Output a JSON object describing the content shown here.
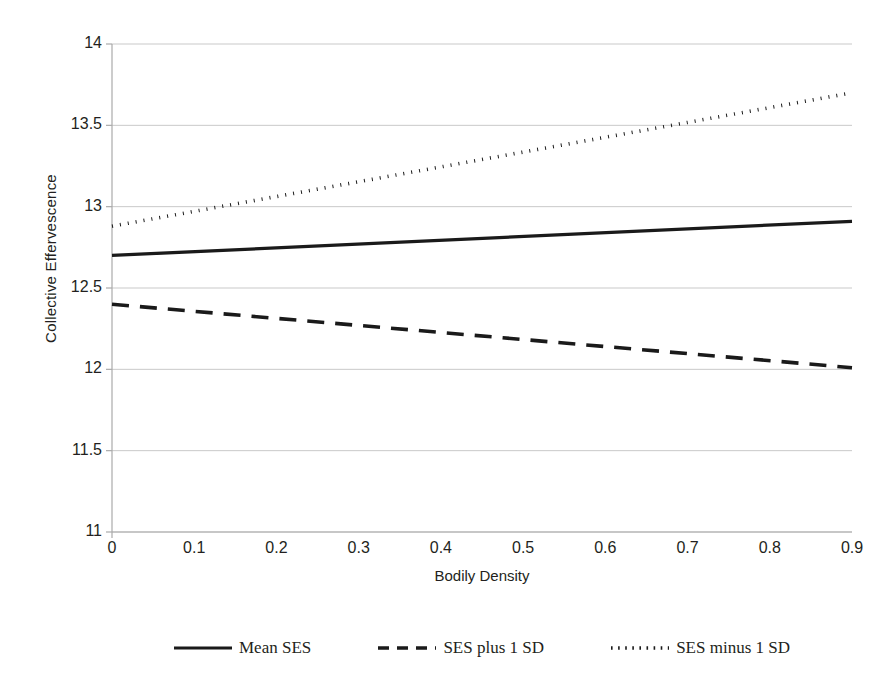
{
  "chart_data": {
    "type": "line",
    "title": "",
    "xlabel": "Bodily Density",
    "ylabel": "Collective Effervescence",
    "xlim": [
      0,
      0.9
    ],
    "ylim": [
      11,
      14
    ],
    "xticks": [
      "0",
      "0.1",
      "0.2",
      "0.3",
      "0.4",
      "0.5",
      "0.6",
      "0.7",
      "0.8",
      "0.9"
    ],
    "xtick_values": [
      0,
      0.1,
      0.2,
      0.3,
      0.4,
      0.5,
      0.6,
      0.7,
      0.8,
      0.9
    ],
    "yticks": [
      "11",
      "11.5",
      "12",
      "12.5",
      "13",
      "13.5",
      "14"
    ],
    "ytick_values": [
      11,
      11.5,
      12,
      12.5,
      13,
      13.5,
      14
    ],
    "grid": "horizontal",
    "legend_position": "bottom",
    "x": [
      0,
      0.9
    ],
    "series": [
      {
        "name": "Mean SES",
        "style": "solid",
        "color": "#1a1a1a",
        "values": [
          12.7,
          12.91
        ]
      },
      {
        "name": "SES plus 1 SD",
        "style": "dashed",
        "color": "#1a1a1a",
        "values": [
          12.4,
          12.01
        ]
      },
      {
        "name": "SES minus 1 SD",
        "style": "dotted",
        "color": "#1a1a1a",
        "values": [
          12.88,
          13.7
        ]
      }
    ]
  },
  "legend": {
    "items": [
      {
        "label": "Mean SES",
        "style": "solid"
      },
      {
        "label": "SES plus 1 SD",
        "style": "dashed"
      },
      {
        "label": "SES minus 1 SD",
        "style": "dotted"
      }
    ]
  },
  "colors": {
    "ink": "#231f20",
    "line": "#1a1a1a",
    "grid": "#c9c9c9",
    "axis": "#aaaaaa",
    "background": "#ffffff"
  }
}
